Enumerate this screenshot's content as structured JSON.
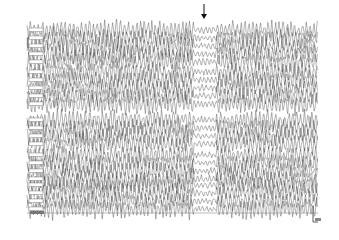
{
  "figure": {
    "type": "eeg-recording",
    "background": "#ffffff",
    "trace_color": "#3a3a3a",
    "label_color": "#6a6a6a",
    "arrow": {
      "x": 204,
      "y_top": 4,
      "y_bottom": 19,
      "meaning": "marker-arrow"
    },
    "trace_area": {
      "x0": 27,
      "x1": 318,
      "y0": 26,
      "y1": 210
    },
    "quiet_region": {
      "x0": 194,
      "x1": 216,
      "amplitude_factor": 0.35
    },
    "groups": [
      {
        "y_start": 30,
        "channels": 5
      },
      {
        "y_start": 72,
        "channels": 5
      },
      {
        "y_start": 120,
        "channels": 4
      },
      {
        "y_start": 155,
        "channels": 4
      },
      {
        "y_start": 185,
        "channels": 4
      }
    ],
    "channel_spacing": 8,
    "amplitude": 7,
    "baseline": {
      "y": 213,
      "x0": 27,
      "x1": 318,
      "color": "#8a8a8a"
    },
    "baseline_label_box": {
      "x": 30,
      "y": 211,
      "w": 14,
      "h": 3
    },
    "scale_bar": {
      "x": 313,
      "y_top": 206,
      "y_bottom": 222,
      "tick_x1": 318,
      "label_box": {
        "x": 315,
        "y": 218,
        "w": 6,
        "h": 3
      }
    }
  }
}
